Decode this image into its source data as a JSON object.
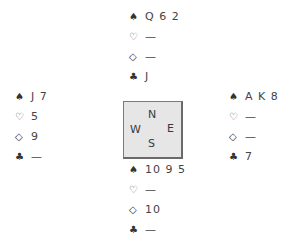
{
  "diagram": {
    "type": "bridge-deal",
    "suit_symbols": {
      "spades": "♠",
      "hearts": "♡",
      "diamonds": "◇",
      "clubs": "♣"
    },
    "compass": {
      "north": "N",
      "west": "W",
      "east": "E",
      "south": "S"
    },
    "hands": {
      "north": {
        "spades": "Q 6 2",
        "hearts": "—",
        "diamonds": "—",
        "clubs": "J"
      },
      "west": {
        "spades": "J 7",
        "hearts": "5",
        "diamonds": "9",
        "clubs": "—"
      },
      "east": {
        "spades": "A K 8",
        "hearts": "—",
        "diamonds": "—",
        "clubs": "7"
      },
      "south": {
        "spades": "10 9 5",
        "hearts": "—",
        "diamonds": "10",
        "clubs": "—"
      }
    }
  }
}
